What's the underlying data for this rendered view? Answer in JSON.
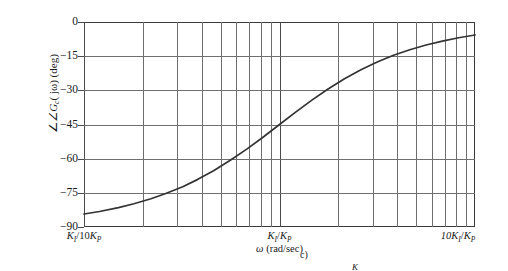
{
  "figure": {
    "caption_fragment": "c)",
    "caption_symbol": "K"
  },
  "axes": {
    "y_label": "∠G",
    "y_label_sub": "c",
    "y_label_arg": "( jω) (deg)",
    "x_label_omega": "ω",
    "x_label_units": " (rad/sec)",
    "y_ticks": [
      "0",
      "−15",
      "−30",
      "−45",
      "−60",
      "−75",
      "−90"
    ],
    "x_ticks": [
      {
        "num": "K",
        "sub": "I",
        "den_pre": "/10",
        "den": "K",
        "den_sub": "P"
      },
      {
        "num": "K",
        "sub": "I",
        "den_pre": "/",
        "den": "K",
        "den_sub": "P"
      },
      {
        "num": "10K",
        "sub": "I",
        "den_pre": "/",
        "den": "K",
        "den_sub": "P"
      }
    ]
  },
  "chart_data": {
    "type": "line",
    "title": "",
    "xlabel": "ω (rad/sec)",
    "ylabel": "∠G_c(jω) (deg)",
    "xscale": "log",
    "xlim": [
      0.1,
      10
    ],
    "ylim": [
      -90,
      0
    ],
    "ytick_values": [
      0,
      -15,
      -30,
      -45,
      -60,
      -75,
      -90
    ],
    "xtick_values": [
      0.1,
      1,
      10
    ],
    "xtick_labels": [
      "K_I/10K_P",
      "K_I/K_P",
      "10K_I/K_P"
    ],
    "grid": "major-and-minor-log",
    "legend": "none",
    "line_color": "#333333",
    "series": [
      {
        "name": "PI controller phase",
        "formula": "-90 + atan(w)",
        "x": [
          0.1,
          0.12,
          0.15,
          0.18,
          0.22,
          0.26,
          0.32,
          0.38,
          0.46,
          0.56,
          0.68,
          0.82,
          1.0,
          1.2,
          1.47,
          1.78,
          2.15,
          2.61,
          3.16,
          3.83,
          4.64,
          5.62,
          6.81,
          8.25,
          10.0
        ],
        "values": [
          -84.3,
          -83.2,
          -81.5,
          -79.8,
          -77.6,
          -75.4,
          -72.3,
          -69.2,
          -65.3,
          -60.7,
          -55.8,
          -50.7,
          -45.0,
          -39.8,
          -34.2,
          -29.3,
          -24.9,
          -21.0,
          -17.6,
          -14.6,
          -12.2,
          -10.1,
          -8.4,
          -6.9,
          -5.7
        ]
      }
    ]
  }
}
